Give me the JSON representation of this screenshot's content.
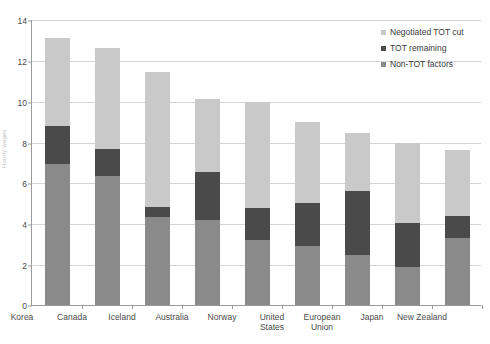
{
  "chart_data": {
    "type": "bar",
    "subtype": "stacked-bar",
    "title": "",
    "xlabel": "",
    "ylabel": "Hourly wages",
    "ylim": [
      0,
      14
    ],
    "ytick_step": 2,
    "yticks": [
      "0",
      "2",
      "4",
      "6",
      "8",
      "10",
      "12",
      "14"
    ],
    "grid": true,
    "legend_position": "top-right",
    "categories": [
      "Korea",
      "Canada",
      "Iceland",
      "Australia",
      "Norway",
      "United\nStates",
      "European\nUnion",
      "Japan",
      "New Zealand"
    ],
    "series": [
      {
        "name": "Non-TOT factors",
        "color": "#8a8a8a",
        "values": [
          6.9,
          6.3,
          4.3,
          4.15,
          3.2,
          2.9,
          2.45,
          1.85,
          3.3
        ]
      },
      {
        "name": "TOT remaining",
        "color": "#4a4a4a",
        "values": [
          1.85,
          1.35,
          0.5,
          2.35,
          1.55,
          2.1,
          3.15,
          2.15,
          1.05
        ]
      },
      {
        "name": "Negotiated TOT cut",
        "color": "#c9c9c9",
        "values": [
          4.3,
          4.95,
          6.6,
          3.6,
          5.2,
          3.95,
          2.8,
          3.95,
          3.25
        ]
      }
    ],
    "totals": [
      13.05,
      12.6,
      11.4,
      10.1,
      9.95,
      8.95,
      8.4,
      7.95,
      7.6
    ]
  },
  "legend": {
    "items": [
      {
        "label": "Negotiated TOT cut",
        "color": "#c9c9c9"
      },
      {
        "label": "TOT remaining",
        "color": "#4a4a4a"
      },
      {
        "label": "Non-TOT factors",
        "color": "#8a8a8a"
      }
    ]
  }
}
